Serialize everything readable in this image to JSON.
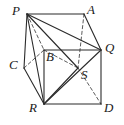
{
  "figure": {
    "kind": "geometry-diagram",
    "width": 124,
    "height": 125,
    "background_color": "#ffffff",
    "line_color": "#2b2b2b",
    "dashed_line_color": "#4a4a4a",
    "labels": [
      {
        "text": "P",
        "x": 12,
        "y": 4,
        "name": "vertex-label-p"
      },
      {
        "text": "A",
        "x": 87,
        "y": 3,
        "name": "vertex-label-a"
      },
      {
        "text": "Q",
        "x": 105,
        "y": 41,
        "name": "vertex-label-q"
      },
      {
        "text": "B",
        "x": 46,
        "y": 50,
        "name": "vertex-label-b"
      },
      {
        "text": "C",
        "x": 9,
        "y": 58,
        "name": "vertex-label-c"
      },
      {
        "text": "S",
        "x": 81,
        "y": 68,
        "name": "vertex-label-s"
      },
      {
        "text": "R",
        "x": 29,
        "y": 101,
        "name": "vertex-label-r"
      },
      {
        "text": "D",
        "x": 104,
        "y": 101,
        "name": "vertex-label-d"
      }
    ],
    "vertices": {
      "P": {
        "x": 27,
        "y": 14
      },
      "A": {
        "x": 84,
        "y": 14
      },
      "Q": {
        "x": 101,
        "y": 50
      },
      "B": {
        "x": 44,
        "y": 50
      },
      "C": {
        "x": 24,
        "y": 68
      },
      "S": {
        "x": 78,
        "y": 68
      },
      "R": {
        "x": 44,
        "y": 104
      },
      "D": {
        "x": 101,
        "y": 104
      }
    },
    "solid_edges": [
      [
        "P",
        "A"
      ],
      [
        "P",
        "C"
      ],
      [
        "C",
        "R"
      ],
      [
        "R",
        "D"
      ],
      [
        "D",
        "Q"
      ],
      [
        "Q",
        "A"
      ],
      [
        "B",
        "Q"
      ],
      [
        "B",
        "R"
      ],
      [
        "R",
        "Q"
      ],
      [
        "R",
        "S"
      ],
      [
        "P",
        "R"
      ],
      [
        "P",
        "S"
      ],
      [
        "P",
        "Q"
      ]
    ],
    "dashed_edges": [
      [
        "P",
        "B"
      ],
      [
        "C",
        "B"
      ],
      [
        "B",
        "S"
      ],
      [
        "A",
        "S"
      ],
      [
        "S",
        "D"
      ]
    ]
  }
}
